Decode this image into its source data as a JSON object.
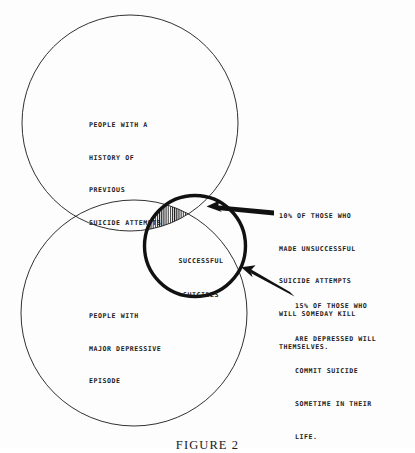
{
  "figure": {
    "caption": "FIGURE 2",
    "type": "venn-diagram",
    "background_color": "#fdfdfd",
    "ink_color": "#1a1a1a"
  },
  "sets": {
    "attempts": {
      "name": "people-with-history-of-previous-suicide-attempts",
      "lines": [
        "PEOPLE WITH A",
        "HISTORY OF",
        "PREVIOUS",
        "SUICIDE ATTEMPTS"
      ],
      "cx": 130,
      "cy": 123,
      "r": 108,
      "stroke_width": 0.9
    },
    "depressive": {
      "name": "people-with-major-depressive-episode",
      "lines": [
        "PEOPLE WITH",
        "MAJOR DEPRESSIVE",
        "EPISODE"
      ],
      "cx": 134,
      "cy": 313,
      "r": 113,
      "stroke_width": 0.9
    },
    "successful": {
      "name": "successful-suicides",
      "lines": [
        "SUCCESSFUL",
        "SUICIDES"
      ],
      "cx": 195,
      "cy": 246,
      "r": 52,
      "stroke_width": 3.4,
      "hatch": "vertical"
    }
  },
  "annotations": [
    {
      "id": "note-10-percent",
      "value": "10%",
      "lines": [
        "10% OF THOSE WHO",
        "MADE UNSUCCESSFUL",
        "SUICIDE ATTEMPTS",
        "WILL SOMEDAY KILL",
        "THEMSELVES."
      ],
      "arrow_from": [
        272,
        213
      ],
      "arrow_to": [
        207,
        206
      ]
    },
    {
      "id": "note-15-percent",
      "value": "15%",
      "lines": [
        "15% OF THOSE WHO",
        "ARE DEPRESSED WILL",
        "COMMIT SUICIDE",
        "SOMETIME IN THEIR",
        "LIFE."
      ],
      "arrow_from": [
        292,
        294
      ],
      "arrow_to": [
        242,
        268
      ]
    }
  ]
}
